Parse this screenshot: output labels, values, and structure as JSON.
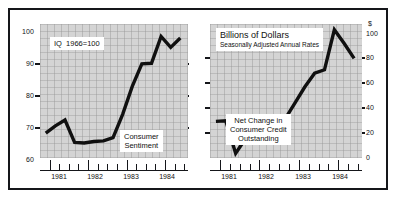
{
  "figure": {
    "background": "#ffffff",
    "frame_color": "#15161a",
    "plot_fill": "#d4d4d4",
    "line_color": "#101010"
  },
  "left_panel": {
    "index_note": "IQ  1966=100",
    "series_label_line1": "Consumer",
    "series_label_line2": "Sentiment",
    "y_ticks": [
      "100",
      "90",
      "80",
      "70",
      "60"
    ],
    "x_ticks": [
      "1981",
      "1982",
      "1983",
      "1984"
    ]
  },
  "right_panel": {
    "units_title": "Billions of Dollars",
    "units_subtitle": "Seasonally Adjusted Annual Rates",
    "dollar_symbol": "$",
    "series_label_line1": "Net Change in",
    "series_label_line2": "Consumer Credit",
    "series_label_line3": "Outstanding",
    "y_ticks": [
      "100",
      "80",
      "60",
      "40",
      "20",
      "0"
    ],
    "x_ticks": [
      "1981",
      "1982",
      "1983",
      "1984"
    ]
  },
  "chart_data": [
    {
      "type": "line",
      "title": "Consumer Sentiment",
      "subtitle": "IQ  1966=100",
      "xlabel": "",
      "ylabel": "Index, 1966=100",
      "ylim": [
        60,
        103
      ],
      "xlim": [
        1980.75,
        1984.6
      ],
      "yticks": [
        60,
        70,
        80,
        90,
        100
      ],
      "xticks": [
        1981,
        1982,
        1983,
        1984
      ],
      "grid": true,
      "legend": "none",
      "x": [
        1980.9,
        1981.15,
        1981.4,
        1981.65,
        1981.9,
        1982.15,
        1982.4,
        1982.65,
        1982.9,
        1983.15,
        1983.4,
        1983.65,
        1983.9,
        1984.15,
        1984.4
      ],
      "values": [
        68.0,
        70.3,
        72.2,
        65.0,
        64.8,
        65.3,
        65.5,
        66.5,
        74.0,
        83.0,
        90.2,
        90.4,
        99.0,
        95.5,
        98.5
      ]
    },
    {
      "type": "line",
      "title": "Net Change in Consumer Credit Outstanding",
      "subtitle": "Billions of Dollars, Seasonally Adjusted Annual Rates",
      "xlabel": "",
      "ylabel": "Billions of Dollars",
      "ylim": [
        -12,
        105
      ],
      "xlim": [
        1980.75,
        1984.6
      ],
      "yticks": [
        0,
        20,
        40,
        60,
        80,
        100
      ],
      "xticks": [
        1981,
        1982,
        1983,
        1984
      ],
      "grid": true,
      "legend": "none",
      "x": [
        1980.9,
        1981.15,
        1981.4,
        1981.65,
        1981.9,
        1982.15,
        1982.4,
        1982.65,
        1982.9,
        1983.15,
        1983.4,
        1983.65,
        1983.9,
        1984.15,
        1984.4
      ],
      "values": [
        20.0,
        20.5,
        -8.0,
        5.0,
        19.0,
        2.0,
        12.0,
        22.0,
        36.0,
        50.0,
        62.0,
        65.0,
        100.0,
        88.0,
        75.0
      ]
    }
  ]
}
